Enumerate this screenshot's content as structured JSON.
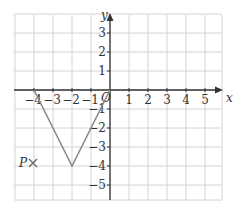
{
  "chart_data": {
    "type": "line",
    "title": "",
    "xlabel": "x",
    "ylabel": "y",
    "xlim": [
      -5,
      5.8
    ],
    "ylim": [
      -5.8,
      4
    ],
    "grid": true,
    "x_ticks": [
      "−4",
      "−3",
      "−2",
      "−1",
      "1",
      "2",
      "3",
      "4",
      "5"
    ],
    "y_ticks": [
      "3",
      "2",
      "1",
      "−1",
      "−2",
      "−3",
      "−4",
      "−5"
    ],
    "origin_label": "O",
    "series": [
      {
        "name": "V-shape",
        "x": [
          -4,
          -2,
          0
        ],
        "y": [
          0,
          -4,
          0
        ],
        "color": "#8a8a8a"
      }
    ],
    "annotations": [
      {
        "label": "P",
        "marker": "×",
        "x": -4,
        "y": -4
      }
    ]
  },
  "colors": {
    "grid": "#d4d4d4",
    "axis": "#333333",
    "line": "#8a8a8a",
    "marker": "#6a6a6a"
  }
}
